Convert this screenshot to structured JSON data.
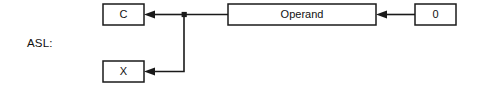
{
  "diagram": {
    "type": "block-flow",
    "row_label": "ASL:",
    "stroke_color": "#1a1a1a",
    "box_fill": "#ffffff",
    "background": "#ffffff",
    "nodes": [
      {
        "id": "c",
        "label": "C",
        "x": 103,
        "y": 4,
        "w": 41,
        "h": 21
      },
      {
        "id": "x",
        "label": "X",
        "x": 103,
        "y": 61,
        "w": 41,
        "h": 21
      },
      {
        "id": "operand",
        "label": "Operand",
        "x": 228,
        "y": 4,
        "w": 148,
        "h": 21
      },
      {
        "id": "zero",
        "label": "0",
        "x": 415,
        "y": 4,
        "w": 41,
        "h": 21
      }
    ],
    "junction": {
      "x": 184,
      "y": 14.5,
      "radius": 2.6
    },
    "edges": [
      {
        "id": "zero-to-operand",
        "from": "zero",
        "to": "operand",
        "arrow": "left"
      },
      {
        "id": "operand-to-junction",
        "from": "operand",
        "to": "junction",
        "arrow": "none"
      },
      {
        "id": "junction-to-c",
        "from": "junction",
        "to": "c",
        "arrow": "left"
      },
      {
        "id": "junction-to-x",
        "from": "junction",
        "to": "x",
        "arrow": "left"
      }
    ]
  }
}
